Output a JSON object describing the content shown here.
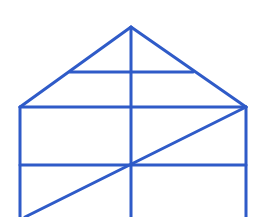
{
  "diagram": {
    "stroke_color": "#2f5bc8",
    "stroke_width": 3,
    "background": "#ffffff",
    "points": {
      "apex": [
        131,
        27
      ],
      "roof_mid_left": [
        70,
        72
      ],
      "roof_mid_right": [
        193,
        72
      ],
      "eave_left": [
        20,
        107
      ],
      "eave_right": [
        246,
        107
      ],
      "wall_mid_left": [
        20,
        165
      ],
      "wall_mid_right": [
        246,
        165
      ],
      "center_mid": [
        131,
        165
      ],
      "bottom_left": [
        20,
        217
      ],
      "bottom_right": [
        246,
        217
      ],
      "bottom_center": [
        131,
        217
      ],
      "diag_bottom": [
        25,
        217
      ]
    },
    "segments": [
      {
        "name": "roof-left-edge",
        "from": [
          131,
          27
        ],
        "to": [
          20,
          107
        ]
      },
      {
        "name": "roof-right-edge",
        "from": [
          131,
          27
        ],
        "to": [
          246,
          107
        ]
      },
      {
        "name": "roof-mid-horizontal",
        "from": [
          70,
          72
        ],
        "to": [
          193,
          72
        ]
      },
      {
        "name": "eave-line",
        "from": [
          20,
          107
        ],
        "to": [
          246,
          107
        ]
      },
      {
        "name": "left-wall",
        "from": [
          20,
          107
        ],
        "to": [
          20,
          217
        ]
      },
      {
        "name": "right-wall",
        "from": [
          246,
          107
        ],
        "to": [
          246,
          217
        ]
      },
      {
        "name": "center-vertical",
        "from": [
          131,
          27
        ],
        "to": [
          131,
          217
        ]
      },
      {
        "name": "wall-mid-horizontal",
        "from": [
          20,
          165
        ],
        "to": [
          246,
          165
        ]
      },
      {
        "name": "diagonal",
        "from": [
          246,
          107
        ],
        "to": [
          25,
          217
        ]
      }
    ]
  }
}
